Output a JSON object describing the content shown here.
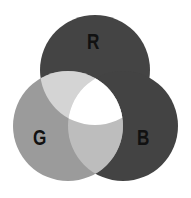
{
  "diagram": {
    "type": "venn",
    "sets": [
      {
        "id": "R",
        "label": "R",
        "cx": 95,
        "cy": 70,
        "r": 55,
        "color": "#444444"
      },
      {
        "id": "G",
        "label": "G",
        "cx": 68,
        "cy": 126,
        "r": 55,
        "color": "#9b9b9b"
      },
      {
        "id": "B",
        "label": "B",
        "cx": 123,
        "cy": 126,
        "r": 55,
        "color": "#434343"
      }
    ],
    "intersections": {
      "RG": "#d4d4d4",
      "GB": "#bdbdbd",
      "RB": "#444444",
      "RGB": "#ffffff"
    },
    "background": "#ffffff"
  }
}
